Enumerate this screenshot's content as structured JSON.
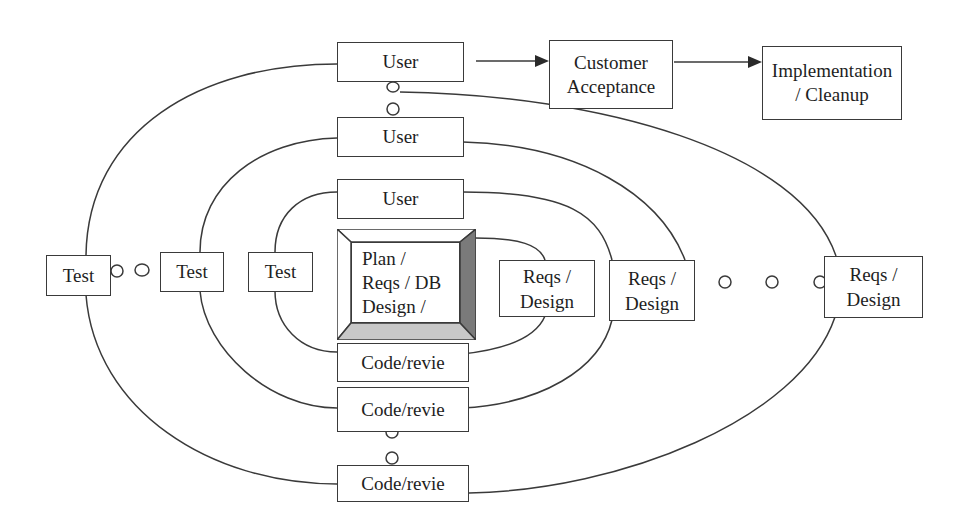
{
  "diagram": {
    "type": "spiral-development-process",
    "colors": {
      "line": "#3a3a3a",
      "background": "#ffffff",
      "bevel_dark": "#7a7a7a",
      "bevel_light": "#c8c8c8"
    },
    "top_flow": {
      "user_final": "User",
      "customer_acceptance": "Customer\nAcceptance",
      "implementation": "Implementation\n/ Cleanup"
    },
    "core": {
      "label": "Plan /\nReqs / DB\nDesign /"
    },
    "user_boxes": [
      "User",
      "User",
      "User"
    ],
    "code_boxes": [
      "Code/revie",
      "Code/revie",
      "Code/revie"
    ],
    "test_boxes": [
      "Test",
      "Test",
      "Test"
    ],
    "reqs_boxes": [
      "Reqs /\nDesign",
      "Reqs /\nDesign",
      "Reqs /\nDesign"
    ],
    "continuation_marks": "circles indicate repeated iterations"
  }
}
